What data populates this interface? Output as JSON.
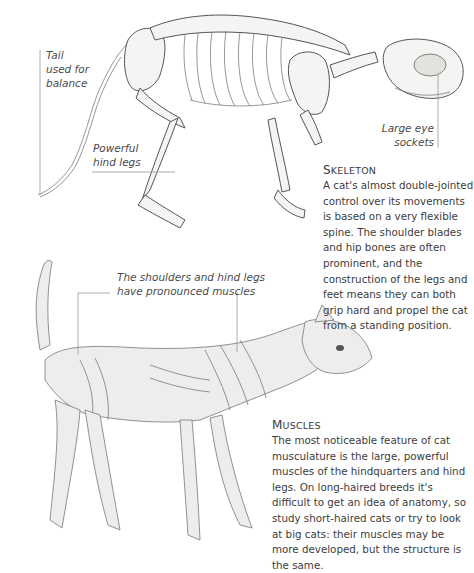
{
  "skeleton_section": {
    "labels": {
      "tail": [
        "Tail",
        "used for",
        "balance"
      ],
      "hind_legs": [
        "Powerful",
        "hind legs"
      ],
      "eye_sockets": [
        "Large eye",
        "sockets"
      ]
    },
    "heading_initial": "S",
    "heading_rest": "keleton",
    "body": "A cat's almost double-jointed control over its movements is based on a very flexible spine. The shoulder blades and hip bones are often prominent, and the construction of the legs and feet means they can both grip hard and propel the cat from a standing position."
  },
  "muscle_section": {
    "labels": {
      "shoulders": [
        "The shoulders and hind legs",
        "have pronounced muscles"
      ]
    },
    "heading_initial": "M",
    "heading_rest": "uscles",
    "body": "The most noticeable feature of cat musculature is the large, powerful muscles of the hindquarters and hind legs. On long-haired breeds it's difficult to get an idea of anatomy, so study short-haired cats or try to look at big cats: their muscles may be more developed, but the structure is the same."
  },
  "illustrations": {
    "skeleton": "cat-skeleton-illustration",
    "muscles": "cat-musculature-illustration"
  },
  "colors": {
    "text": "#3a3a3a",
    "leader_line": "#9a9a9a",
    "background": "#ffffff"
  }
}
